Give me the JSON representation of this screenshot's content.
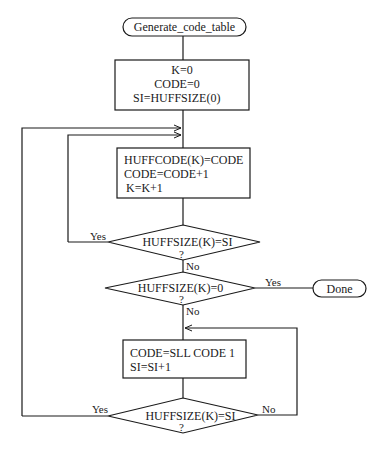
{
  "flowchart": {
    "start": {
      "label": "Generate_code_table"
    },
    "init_box": {
      "lines": [
        "K=0",
        "CODE=0",
        "SI=HUFFSIZE(0)"
      ]
    },
    "assign_box": {
      "lines": [
        "HUFFCODE(K)=CODE",
        "CODE=CODE+1",
        "K=K+1"
      ]
    },
    "decision1": {
      "label": "HUFFSIZE(K)=SI",
      "q": "?",
      "yes": "Yes",
      "no": "No"
    },
    "decision2": {
      "label": "HUFFSIZE(K)=0",
      "q": "?",
      "yes": "Yes",
      "no": "No"
    },
    "done": {
      "label": "Done"
    },
    "shift_box": {
      "lines": [
        "CODE=SLL CODE 1",
        "SI=SI+1"
      ]
    },
    "decision3": {
      "label": "HUFFSIZE(K)=SI",
      "q": "?",
      "yes": "Yes",
      "no": "No"
    }
  },
  "colors": {
    "stroke": "#1a1a1a",
    "background": "#ffffff"
  }
}
